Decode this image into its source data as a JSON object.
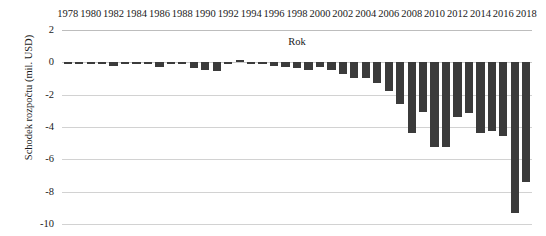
{
  "chart_data": {
    "type": "bar",
    "title": "",
    "xlabel": "Rok",
    "ylabel": "Schodek rozpočtu (mil. USD)",
    "ylim": [
      -10,
      2
    ],
    "ytick_labels": [
      "2",
      "0",
      "-2",
      "-4",
      "-6",
      "-8",
      "-10"
    ],
    "ytick_values": [
      2,
      0,
      -2,
      -4,
      -6,
      -8,
      -10
    ],
    "grid": true,
    "legend": null,
    "xaxis_position": "top",
    "bar_color": "#3b3b3b",
    "gridline_color": "#d2d2d2",
    "xtick_labels": [
      "1978",
      "1980",
      "1982",
      "1984",
      "1986",
      "1988",
      "1990",
      "1992",
      "1994",
      "1996",
      "1998",
      "2000",
      "2002",
      "2004",
      "2006",
      "2008",
      "2010",
      "2012",
      "2014",
      "2016",
      "2018"
    ],
    "categories": [
      1978,
      1979,
      1980,
      1981,
      1982,
      1983,
      1984,
      1985,
      1986,
      1987,
      1988,
      1989,
      1990,
      1991,
      1992,
      1993,
      1994,
      1995,
      1996,
      1997,
      1998,
      1999,
      2000,
      2001,
      2002,
      2003,
      2004,
      2005,
      2006,
      2007,
      2008,
      2009,
      2010,
      2011,
      2012,
      2013,
      2014,
      2015,
      2016,
      2017,
      2018
    ],
    "values": [
      -0.05,
      -0.05,
      -0.1,
      -0.06,
      -0.25,
      -0.05,
      -0.05,
      -0.05,
      -0.3,
      -0.05,
      -0.05,
      -0.35,
      -0.45,
      -0.55,
      -0.05,
      0.15,
      -0.05,
      -0.05,
      -0.25,
      -0.3,
      -0.35,
      -0.45,
      -0.3,
      -0.45,
      -0.7,
      -0.95,
      -1.0,
      -1.3,
      -1.75,
      -2.55,
      -4.35,
      -3.1,
      -5.25,
      -5.25,
      -3.4,
      -3.15,
      -4.35,
      -4.25,
      -4.55,
      -9.3,
      -7.4
    ]
  }
}
